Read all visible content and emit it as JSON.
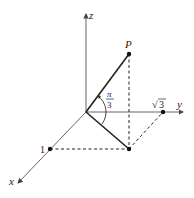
{
  "diagram": {
    "type": "3d-coordinate-axes",
    "axes": {
      "x_label": "x",
      "y_label": "y",
      "z_label": "z"
    },
    "points": {
      "P_label": "P",
      "x_tick_label": "1",
      "y_tick_label": "√3",
      "y_tick_radicand": "3",
      "y_tick_radical": "√"
    },
    "angle": {
      "numerator": "π",
      "denominator": "3",
      "description": "angle between OP and its projection onto xy-plane"
    },
    "colors": {
      "axis": "#555555",
      "segment": "#222222",
      "dashed": "#222222",
      "point": "#111111"
    }
  }
}
